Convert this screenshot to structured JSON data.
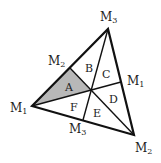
{
  "diagram": {
    "title": "",
    "colors": {
      "stroke": "#111111",
      "shaded": "#b8b8b8",
      "background": "#ffffff"
    },
    "vertices": {
      "left": {
        "name": "M",
        "sub": "1",
        "x": 32,
        "y": 106
      },
      "top": {
        "name": "M",
        "sub": "3",
        "x": 108,
        "y": 29
      },
      "bottom": {
        "name": "M",
        "sub": "2",
        "x": 134,
        "y": 135
      }
    },
    "midpoints": {
      "left_edge": {
        "name": "M",
        "sub": "2",
        "x": 70,
        "y": 68
      },
      "right_edge": {
        "name": "M",
        "sub": "1",
        "x": 121,
        "y": 82
      },
      "bottom_edge": {
        "name": "M",
        "sub": "3",
        "x": 83,
        "y": 120
      }
    },
    "centroid": {
      "x": 91,
      "y": 90
    },
    "regions": [
      {
        "label": "A",
        "shaded": true
      },
      {
        "label": "B",
        "shaded": false
      },
      {
        "label": "C",
        "shaded": false
      },
      {
        "label": "D",
        "shaded": false
      },
      {
        "label": "E",
        "shaded": false
      },
      {
        "label": "F",
        "shaded": false
      }
    ]
  }
}
